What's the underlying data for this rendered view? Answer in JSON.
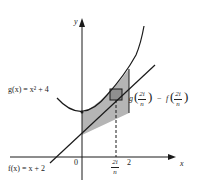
{
  "diagram": {
    "type": "area-between-curves",
    "functions": [
      {
        "name": "g",
        "label": "g(x) = x² + 4",
        "expression": "x^2 + 4"
      },
      {
        "name": "f",
        "label": "f(x) = x + 2",
        "expression": "x + 2"
      }
    ],
    "axes": {
      "x_label": "x",
      "y_label": "y"
    },
    "ticks": {
      "origin": "0",
      "right_bound": "2",
      "sample_point_num": "2i",
      "sample_point_den": "n"
    },
    "rectangle_height_label": {
      "g_name": "g",
      "f_name": "f",
      "minus": "−",
      "num": "2i",
      "den": "n"
    },
    "interval": [
      0,
      2
    ],
    "colors": {
      "shade": "#b0b0b0",
      "rect": "#8a8a8a",
      "stroke": "#1a1a1a"
    }
  }
}
